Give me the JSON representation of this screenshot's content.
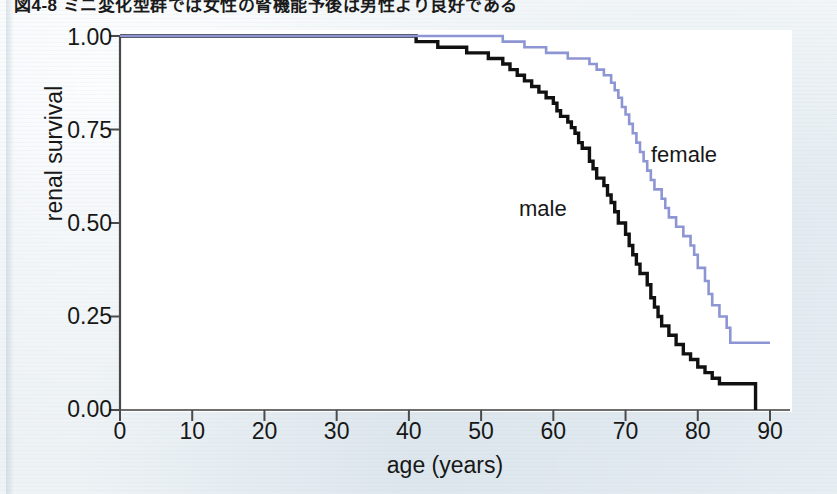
{
  "figure": {
    "caption": "図4-8 ミニ変化型群では女性の腎機能予後は男性より良好である",
    "axes": {
      "x_label": "age (years)",
      "y_label": "renal survival",
      "x_ticks": [
        "0",
        "10",
        "20",
        "30",
        "40",
        "50",
        "60",
        "70",
        "80",
        "90"
      ],
      "y_ticks": [
        "1.00",
        "0.75",
        "0.50",
        "0.25",
        "0.00"
      ]
    },
    "annotations": {
      "male_label": "male",
      "female_label": "female"
    },
    "colors": {
      "male": "#111111",
      "female": "#8e95d4",
      "axis": "#6e6e6e",
      "plot_background": "#ffffff",
      "page_background": "#eef2f5"
    }
  },
  "chart_data": {
    "type": "line",
    "title": "",
    "xlabel": "age (years)",
    "ylabel": "renal survival",
    "xlim": [
      0,
      90
    ],
    "ylim": [
      0.0,
      1.0
    ],
    "x_ticks": [
      0,
      10,
      20,
      30,
      40,
      50,
      60,
      70,
      80,
      90
    ],
    "y_ticks": [
      1.0,
      0.75,
      0.5,
      0.25,
      0.0
    ],
    "grid": false,
    "legend": "inline-annotations",
    "step_style": "post",
    "series": [
      {
        "name": "male",
        "color": "#111111",
        "points": [
          [
            0,
            1.0
          ],
          [
            40,
            1.0
          ],
          [
            41,
            0.985
          ],
          [
            43,
            0.985
          ],
          [
            44,
            0.97
          ],
          [
            47,
            0.97
          ],
          [
            48,
            0.955
          ],
          [
            50,
            0.955
          ],
          [
            51,
            0.94
          ],
          [
            52,
            0.94
          ],
          [
            53,
            0.925
          ],
          [
            54,
            0.91
          ],
          [
            55,
            0.895
          ],
          [
            56,
            0.88
          ],
          [
            57,
            0.865
          ],
          [
            58,
            0.85
          ],
          [
            59,
            0.835
          ],
          [
            60,
            0.82
          ],
          [
            60.5,
            0.8
          ],
          [
            61,
            0.785
          ],
          [
            62,
            0.77
          ],
          [
            62.5,
            0.755
          ],
          [
            63,
            0.74
          ],
          [
            63.5,
            0.715
          ],
          [
            64,
            0.7
          ],
          [
            65,
            0.665
          ],
          [
            65.5,
            0.645
          ],
          [
            66,
            0.62
          ],
          [
            67,
            0.6
          ],
          [
            67.5,
            0.575
          ],
          [
            68,
            0.555
          ],
          [
            68.5,
            0.53
          ],
          [
            69,
            0.5
          ],
          [
            70,
            0.47
          ],
          [
            70.5,
            0.44
          ],
          [
            71,
            0.415
          ],
          [
            71.5,
            0.39
          ],
          [
            72,
            0.365
          ],
          [
            73,
            0.335
          ],
          [
            73.5,
            0.3
          ],
          [
            74,
            0.275
          ],
          [
            74.5,
            0.25
          ],
          [
            75,
            0.225
          ],
          [
            76,
            0.2
          ],
          [
            77,
            0.175
          ],
          [
            78,
            0.15
          ],
          [
            79,
            0.135
          ],
          [
            80,
            0.115
          ],
          [
            81,
            0.1
          ],
          [
            82,
            0.085
          ],
          [
            83,
            0.07
          ],
          [
            88,
            0.07
          ],
          [
            88,
            0.0
          ]
        ]
      },
      {
        "name": "female",
        "color": "#8e95d4",
        "points": [
          [
            0,
            1.0
          ],
          [
            52,
            1.0
          ],
          [
            53,
            0.985
          ],
          [
            55,
            0.985
          ],
          [
            56,
            0.97
          ],
          [
            58,
            0.97
          ],
          [
            59,
            0.955
          ],
          [
            61,
            0.955
          ],
          [
            62,
            0.94
          ],
          [
            64,
            0.94
          ],
          [
            65,
            0.925
          ],
          [
            66,
            0.91
          ],
          [
            67,
            0.895
          ],
          [
            68,
            0.875
          ],
          [
            68.5,
            0.855
          ],
          [
            69,
            0.835
          ],
          [
            69.5,
            0.81
          ],
          [
            70,
            0.79
          ],
          [
            70.5,
            0.765
          ],
          [
            71,
            0.74
          ],
          [
            71.5,
            0.715
          ],
          [
            72,
            0.69
          ],
          [
            72.5,
            0.665
          ],
          [
            73,
            0.64
          ],
          [
            73.5,
            0.615
          ],
          [
            74,
            0.59
          ],
          [
            75,
            0.565
          ],
          [
            75.5,
            0.54
          ],
          [
            76,
            0.515
          ],
          [
            77,
            0.49
          ],
          [
            78,
            0.465
          ],
          [
            79,
            0.44
          ],
          [
            79.5,
            0.415
          ],
          [
            80,
            0.38
          ],
          [
            81,
            0.345
          ],
          [
            81.5,
            0.31
          ],
          [
            82,
            0.28
          ],
          [
            83,
            0.25
          ],
          [
            84,
            0.22
          ],
          [
            84.5,
            0.18
          ],
          [
            90,
            0.18
          ]
        ]
      }
    ]
  }
}
